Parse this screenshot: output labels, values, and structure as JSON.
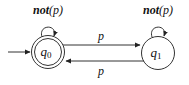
{
  "diagram": {
    "type": "finite-state-automaton",
    "states": [
      {
        "id": "q0",
        "label_base": "q",
        "label_sub": "0",
        "accepting": true,
        "initial": true
      },
      {
        "id": "q1",
        "label_base": "q",
        "label_sub": "1",
        "accepting": false,
        "initial": false
      }
    ],
    "transitions": [
      {
        "from": "q0",
        "to": "q0",
        "label_bold": "not",
        "label_rest": "(p)"
      },
      {
        "from": "q1",
        "to": "q1",
        "label_bold": "not",
        "label_rest": "(p)"
      },
      {
        "from": "q0",
        "to": "q1",
        "label": "p"
      },
      {
        "from": "q1",
        "to": "q0",
        "label": "p"
      }
    ]
  }
}
